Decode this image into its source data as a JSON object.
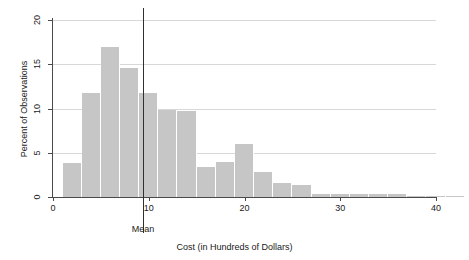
{
  "chart_data": {
    "type": "bar",
    "title": "",
    "xlabel": "Cost (in Hundreds of Dollars)",
    "ylabel": "Percent of Observations",
    "xlim": [
      0,
      41
    ],
    "ylim": [
      0,
      21
    ],
    "grid": true,
    "legend": null,
    "bin_width": 2,
    "xticks": [
      0,
      10,
      20,
      30,
      40
    ],
    "xtick_labels": [
      "0",
      "10",
      "20",
      "30",
      "40"
    ],
    "yticks": [
      0,
      5,
      10,
      15,
      20
    ],
    "ytick_labels": [
      "0",
      "5",
      "10",
      "15",
      "20"
    ],
    "bar_color": "#c6c6c6",
    "grid_color": "#d8d8d8",
    "axis_color": "#4a4a4a",
    "annotations": [
      {
        "name": "mean-line",
        "label": "Mean",
        "x": 9.4,
        "color": "#303030"
      }
    ],
    "bins": [
      {
        "x0": 1,
        "x1": 3,
        "center": 2,
        "value": 3.8
      },
      {
        "x0": 3,
        "x1": 5,
        "center": 4,
        "value": 11.8
      },
      {
        "x0": 5,
        "x1": 7,
        "center": 6,
        "value": 17.0
      },
      {
        "x0": 7,
        "x1": 9,
        "center": 8,
        "value": 14.6
      },
      {
        "x0": 9,
        "x1": 11,
        "center": 10,
        "value": 11.8
      },
      {
        "x0": 11,
        "x1": 13,
        "center": 12,
        "value": 9.8
      },
      {
        "x0": 13,
        "x1": 15,
        "center": 14,
        "value": 9.7
      },
      {
        "x0": 15,
        "x1": 17,
        "center": 16,
        "value": 3.4
      },
      {
        "x0": 17,
        "x1": 19,
        "center": 18,
        "value": 4.0
      },
      {
        "x0": 19,
        "x1": 21,
        "center": 20,
        "value": 6.0
      },
      {
        "x0": 21,
        "x1": 23,
        "center": 22,
        "value": 2.8
      },
      {
        "x0": 23,
        "x1": 25,
        "center": 24,
        "value": 1.6
      },
      {
        "x0": 25,
        "x1": 27,
        "center": 26,
        "value": 1.4
      },
      {
        "x0": 27,
        "x1": 29,
        "center": 28,
        "value": 0.35
      },
      {
        "x0": 29,
        "x1": 31,
        "center": 30,
        "value": 0.35
      },
      {
        "x0": 31,
        "x1": 33,
        "center": 32,
        "value": 0.35
      },
      {
        "x0": 33,
        "x1": 35,
        "center": 34,
        "value": 0.35
      },
      {
        "x0": 35,
        "x1": 37,
        "center": 36,
        "value": 0.3
      },
      {
        "x0": 37,
        "x1": 39,
        "center": 38,
        "value": 0.15
      },
      {
        "x0": 39,
        "x1": 41,
        "center": 40,
        "value": 0.15
      },
      {
        "x0": 41,
        "x1": 43,
        "center": 42,
        "value": 0.15
      },
      {
        "x0": 45,
        "x1": 47,
        "center": 46,
        "value": 0.15
      },
      {
        "x0": 47,
        "x1": 49,
        "center": 48,
        "value": 0.1
      }
    ],
    "categories": [
      "2",
      "4",
      "6",
      "8",
      "10",
      "12",
      "14",
      "16",
      "18",
      "20",
      "22",
      "24",
      "26",
      "28",
      "30",
      "32",
      "34",
      "36",
      "38",
      "40",
      "42",
      "46",
      "48"
    ],
    "values": [
      3.8,
      11.8,
      17.0,
      14.6,
      11.8,
      9.8,
      9.7,
      3.4,
      4.0,
      6.0,
      2.8,
      1.6,
      1.4,
      0.35,
      0.35,
      0.35,
      0.35,
      0.3,
      0.15,
      0.15,
      0.15,
      0.15,
      0.1
    ]
  }
}
